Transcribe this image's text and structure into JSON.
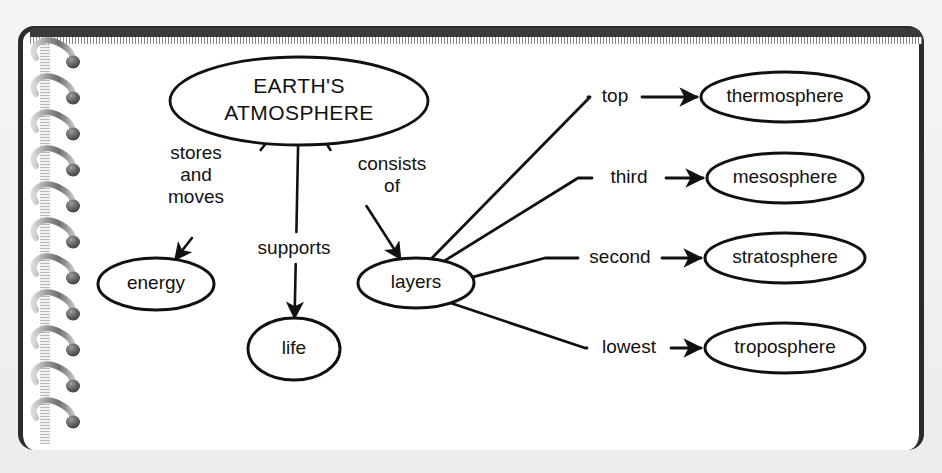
{
  "document": {
    "medium": "spiral-bound notebook page",
    "title": "Earth's Atmosphere concept map"
  },
  "colors": {
    "paper": "#ffffff",
    "ink": "#111111",
    "cover": "#2b2b2b",
    "backdrop": "#f1f1f1",
    "spiral": "#8f8f8f"
  },
  "diagram": {
    "type": "concept-map",
    "nodes": [
      {
        "id": "atmosphere",
        "label": "EARTH'S\nATMOSPHERE",
        "line1": "EARTH'S",
        "line2": "ATMOSPHERE",
        "cx": 299,
        "cy": 101,
        "rx": 129,
        "ry": 44,
        "font_size": 21,
        "letter_spacing": 0.4
      },
      {
        "id": "energy",
        "label": "energy",
        "cx": 156,
        "cy": 284,
        "rx": 58,
        "ry": 26,
        "font_size": 19
      },
      {
        "id": "life",
        "label": "life",
        "cx": 294,
        "cy": 349,
        "rx": 46,
        "ry": 31,
        "font_size": 19
      },
      {
        "id": "layers",
        "label": "layers",
        "cx": 416,
        "cy": 283,
        "rx": 58,
        "ry": 25,
        "font_size": 19
      },
      {
        "id": "thermosphere",
        "label": "thermosphere",
        "cx": 785,
        "cy": 97,
        "rx": 84,
        "ry": 25,
        "font_size": 19
      },
      {
        "id": "mesosphere",
        "label": "mesosphere",
        "cx": 785,
        "cy": 178,
        "rx": 78,
        "ry": 25,
        "font_size": 19
      },
      {
        "id": "stratosphere",
        "label": "stratosphere",
        "cx": 785,
        "cy": 258,
        "rx": 80,
        "ry": 25,
        "font_size": 19
      },
      {
        "id": "troposphere",
        "label": "troposphere",
        "cx": 785,
        "cy": 348,
        "rx": 80,
        "ry": 25,
        "font_size": 19
      }
    ],
    "edges": [
      {
        "id": "edge-stores-and-moves",
        "from": "atmosphere",
        "to": "energy",
        "label": "stores\nand\nmoves",
        "label_lines": [
          "stores",
          "and",
          "moves"
        ],
        "label_x": 196,
        "label_y": 176,
        "label_font_size": 19,
        "label_anchor": "middle"
      },
      {
        "id": "edge-supports",
        "from": "atmosphere",
        "to": "life",
        "label": "supports",
        "label_lines": [
          "supports"
        ],
        "label_x": 294,
        "label_y": 249,
        "label_font_size": 19,
        "label_anchor": "middle"
      },
      {
        "id": "edge-consists-of",
        "from": "atmosphere",
        "to": "layers",
        "label": "consists\nof",
        "label_lines": [
          "consists",
          "of"
        ],
        "label_x": 392,
        "label_y": 176,
        "label_font_size": 19,
        "label_anchor": "middle"
      },
      {
        "id": "edge-top",
        "from": "layers",
        "to": "thermosphere",
        "label": "top",
        "label_lines": [
          "top"
        ],
        "label_x": 615,
        "label_y": 97,
        "label_font_size": 19,
        "label_anchor": "middle"
      },
      {
        "id": "edge-third",
        "from": "layers",
        "to": "mesosphere",
        "label": "third",
        "label_lines": [
          "third"
        ],
        "label_x": 629,
        "label_y": 178,
        "label_font_size": 19,
        "label_anchor": "middle"
      },
      {
        "id": "edge-second",
        "from": "layers",
        "to": "stratosphere",
        "label": "second",
        "label_lines": [
          "second"
        ],
        "label_x": 620,
        "label_y": 258,
        "label_font_size": 19,
        "label_anchor": "middle"
      },
      {
        "id": "edge-lowest",
        "from": "layers",
        "to": "troposphere",
        "label": "lowest",
        "label_lines": [
          "lowest"
        ],
        "label_x": 629,
        "label_y": 348,
        "label_font_size": 19,
        "label_anchor": "middle"
      }
    ],
    "hierarchy_note": {
      "root": "EARTH'S ATMOSPHERE",
      "branches": [
        {
          "relation": "stores and moves",
          "target": "energy"
        },
        {
          "relation": "supports",
          "target": "life"
        },
        {
          "relation": "consists of",
          "target": "layers"
        }
      ],
      "layer_order": [
        {
          "rank": "top",
          "target": "thermosphere"
        },
        {
          "rank": "third",
          "target": "mesosphere"
        },
        {
          "rank": "second",
          "target": "stratosphere"
        },
        {
          "rank": "lowest",
          "target": "troposphere"
        }
      ]
    }
  },
  "spiral": {
    "coil_count": 11,
    "icon": "spiral-binding-icon"
  }
}
